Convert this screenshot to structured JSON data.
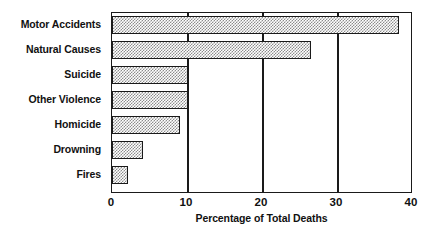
{
  "chart_data": {
    "type": "bar",
    "orientation": "horizontal",
    "title": "",
    "xlabel": "Percentage of Total Deaths",
    "ylabel": "",
    "categories": [
      "Motor Accidents",
      "Natural Causes",
      "Suicide",
      "Other Violence",
      "Homicide",
      "Drowning",
      "Fires"
    ],
    "values": [
      38.3,
      26.5,
      10.0,
      10.0,
      8.9,
      3.9,
      2.0
    ],
    "xlim": [
      0,
      40
    ],
    "xticks": [
      0,
      10,
      20,
      30,
      40
    ],
    "xtick_labels": [
      "0",
      "10",
      "20",
      "30",
      "40"
    ],
    "grid": "vertical",
    "legend": "none",
    "bar_fill": "#8c8c8c",
    "bar_edge": "#1a1a1a",
    "background": "#ffffff"
  }
}
